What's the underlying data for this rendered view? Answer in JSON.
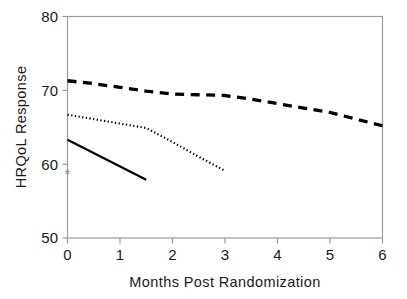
{
  "chart_data": {
    "type": "line",
    "title": "",
    "xlabel": "Months Post Randomization",
    "ylabel": "HRQoL Response",
    "xlim": [
      0,
      6
    ],
    "ylim": [
      50,
      80
    ],
    "xticks": [
      0,
      1,
      2,
      3,
      4,
      5,
      6
    ],
    "xtick_labels": [
      "0",
      "1",
      "2",
      "3",
      "4",
      "5",
      "6"
    ],
    "yticks": [
      50,
      60,
      70,
      80
    ],
    "ytick_labels": [
      "50",
      "60",
      "70",
      "80"
    ],
    "grid": false,
    "legend": "none",
    "series": [
      {
        "name": "dashed-series",
        "style": "dashed",
        "color": "#000000",
        "x": [
          0,
          0.5,
          1,
          1.5,
          2,
          2.5,
          3,
          3.5,
          4,
          4.5,
          5,
          5.5,
          6
        ],
        "y": [
          71.3,
          70.9,
          70.4,
          69.9,
          69.5,
          69.4,
          69.3,
          68.8,
          68.2,
          67.6,
          67.0,
          66.1,
          65.2
        ]
      },
      {
        "name": "dotted-series",
        "style": "dotted",
        "color": "#000000",
        "x": [
          0,
          0.5,
          1,
          1.5,
          2,
          2.5,
          3
        ],
        "y": [
          66.7,
          66.1,
          65.5,
          64.9,
          63.0,
          61.0,
          59.1
        ]
      },
      {
        "name": "solid-series",
        "style": "solid",
        "color": "#000000",
        "x": [
          0,
          1.5
        ],
        "y": [
          63.3,
          57.9
        ]
      }
    ],
    "annotations": [
      {
        "name": "asterisk-marker",
        "symbol": "*",
        "x": 0,
        "y": 58.7,
        "color": "#8c8c8c"
      }
    ]
  },
  "axes": {
    "y_title": "HRQoL Response",
    "x_title": "Months Post Randomization",
    "y_labels": [
      "80",
      "70",
      "60",
      "50"
    ],
    "x_labels": [
      "0",
      "1",
      "2",
      "3",
      "4",
      "5",
      "6"
    ]
  },
  "colors": {
    "line": "#000000",
    "frame": "#9a9a9a",
    "text": "#1a1a1a",
    "marker": "#8c8c8c",
    "background": "#ffffff"
  }
}
